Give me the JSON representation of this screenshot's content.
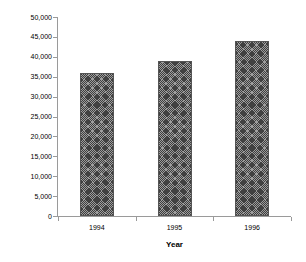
{
  "chart_data": {
    "type": "bar",
    "title": "",
    "categories": [
      "1994",
      "1995",
      "1996"
    ],
    "values": [
      36000,
      39000,
      44000
    ],
    "series": [
      {
        "name": "Number vicuñas",
        "values": [
          36000,
          39000,
          44000
        ]
      }
    ],
    "xlabel": "Year",
    "ylabel": "Number vicuñas",
    "ylim": [
      0,
      50000
    ],
    "ytick_step": 5000,
    "ytick_labels": [
      "50,000",
      "45,000",
      "40,000",
      "35,000",
      "30,000",
      "25,000",
      "20,000",
      "15,000",
      "10,000",
      "5,000",
      "0"
    ],
    "ytick_values": [
      50000,
      45000,
      40000,
      35000,
      30000,
      25000,
      20000,
      15000,
      10000,
      5000,
      0
    ],
    "grid": false,
    "legend": "none",
    "bar_fill": "diagonal-crosshatch",
    "bar_fill_color": "#9d9d9d",
    "bar_border_color": "#555555",
    "axis_color": "#9a9a9a",
    "text_color": "#000000",
    "background": "#ffffff"
  }
}
